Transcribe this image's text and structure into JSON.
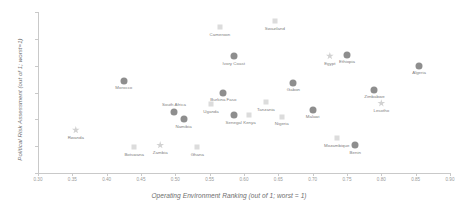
{
  "chart_data": {
    "type": "scatter",
    "title": "",
    "xlabel": "Operating Environment Ranking (out of 1; worst = 1)",
    "ylabel": "Political Risk Assessment (out of 1; worst=1)",
    "xlim": [
      0.3,
      0.9
    ],
    "ylim": [
      0.5,
      0.8
    ],
    "xticks": [
      "0.30",
      "0.35",
      "0.40",
      "0.45",
      "0.50",
      "0.55",
      "0.60",
      "0.65",
      "0.70",
      "0.75",
      "0.80",
      "0.85",
      "0.90"
    ],
    "yticks": [
      "0.80",
      "0.75",
      "0.70",
      "0.65",
      "0.60",
      "0.55",
      "0.50"
    ],
    "grid": false,
    "legend": "none",
    "marker_types": [
      "circle",
      "square",
      "star"
    ],
    "colors": {
      "circle": "#8e8e8e",
      "square": "#dcdcdc",
      "star": "#d2d2d2",
      "axis": "#c9c9c9",
      "tick_text": "#9a9a9a",
      "label_text": "#808080",
      "axis_title": "#6e6e6e",
      "background": "#ffffff"
    },
    "points": [
      {
        "name": "Cameroon",
        "x": 0.565,
        "y": 0.772,
        "marker": "square",
        "label_pos": "below"
      },
      {
        "name": "Swaziland",
        "x": 0.645,
        "y": 0.783,
        "marker": "square",
        "label_pos": "below"
      },
      {
        "name": "Ivory Coast",
        "x": 0.585,
        "y": 0.718,
        "marker": "circle",
        "label_pos": "below"
      },
      {
        "name": "Egypt",
        "x": 0.725,
        "y": 0.718,
        "marker": "star",
        "label_pos": "below"
      },
      {
        "name": "Ethiopia",
        "x": 0.75,
        "y": 0.72,
        "marker": "circle",
        "label_pos": "below"
      },
      {
        "name": "Algeria",
        "x": 0.855,
        "y": 0.7,
        "marker": "circle",
        "label_pos": "below"
      },
      {
        "name": "Morocco",
        "x": 0.425,
        "y": 0.672,
        "marker": "circle",
        "label_pos": "below"
      },
      {
        "name": "Gabon",
        "x": 0.672,
        "y": 0.668,
        "marker": "circle",
        "label_pos": "below"
      },
      {
        "name": "Zimbabwe",
        "x": 0.79,
        "y": 0.655,
        "marker": "circle",
        "label_pos": "below"
      },
      {
        "name": "Burkina Faso",
        "x": 0.57,
        "y": 0.65,
        "marker": "circle",
        "label_pos": "below"
      },
      {
        "name": "Lesotho",
        "x": 0.8,
        "y": 0.63,
        "marker": "star",
        "label_pos": "below"
      },
      {
        "name": "Uganda",
        "x": 0.552,
        "y": 0.628,
        "marker": "square",
        "label_pos": "below"
      },
      {
        "name": "Tanzania",
        "x": 0.632,
        "y": 0.632,
        "marker": "square",
        "label_pos": "below"
      },
      {
        "name": "South Africa",
        "x": 0.498,
        "y": 0.613,
        "marker": "circle",
        "label_pos": "above"
      },
      {
        "name": "Namibia",
        "x": 0.512,
        "y": 0.6,
        "marker": "circle",
        "label_pos": "below"
      },
      {
        "name": "Senegal",
        "x": 0.585,
        "y": 0.608,
        "marker": "circle",
        "label_pos": "below"
      },
      {
        "name": "Kenya",
        "x": 0.608,
        "y": 0.608,
        "marker": "square",
        "label_pos": "below"
      },
      {
        "name": "Nigeria",
        "x": 0.655,
        "y": 0.605,
        "marker": "square",
        "label_pos": "below"
      },
      {
        "name": "Malawi",
        "x": 0.7,
        "y": 0.618,
        "marker": "circle",
        "label_pos": "below"
      },
      {
        "name": "Rwanda",
        "x": 0.355,
        "y": 0.58,
        "marker": "star",
        "label_pos": "below"
      },
      {
        "name": "Mozambique",
        "x": 0.735,
        "y": 0.565,
        "marker": "square",
        "label_pos": "below"
      },
      {
        "name": "Benin",
        "x": 0.762,
        "y": 0.552,
        "marker": "circle",
        "label_pos": "below"
      },
      {
        "name": "Botswana",
        "x": 0.44,
        "y": 0.548,
        "marker": "square",
        "label_pos": "below"
      },
      {
        "name": "Zambia",
        "x": 0.478,
        "y": 0.552,
        "marker": "star",
        "label_pos": "below"
      },
      {
        "name": "Ghana",
        "x": 0.532,
        "y": 0.548,
        "marker": "square",
        "label_pos": "below"
      }
    ]
  }
}
